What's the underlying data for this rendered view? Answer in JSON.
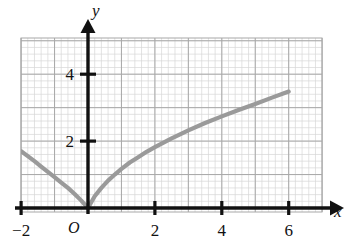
{
  "figure": {
    "background_color": "#ffffff",
    "axis_color": "#111111",
    "grid_minor_color": "#d7d7d7",
    "grid_major_color": "#a8a8a8",
    "curve_color": "#9a9a9a"
  },
  "axes": {
    "x_axis_label": "x",
    "y_axis_label": "y",
    "origin_label": "O",
    "x_ticks": [
      {
        "value": -2,
        "label": "−2"
      },
      {
        "value": 2,
        "label": "2"
      },
      {
        "value": 4,
        "label": "4"
      },
      {
        "value": 6,
        "label": "6"
      }
    ],
    "y_ticks": [
      {
        "value": 2,
        "label": "2"
      },
      {
        "value": 4,
        "label": "4"
      }
    ]
  },
  "chart_data": {
    "type": "line",
    "title": "",
    "xlabel": "x",
    "ylabel": "y",
    "xlim": [
      -2.55,
      7.05
    ],
    "ylim": [
      -0.6,
      5.1
    ],
    "grid": true,
    "minor_grid": true,
    "legend": "none",
    "series": [
      {
        "name": "curve",
        "color": "#9a9a9a",
        "x": [
          -2.0,
          -1.8,
          -1.6,
          -1.4,
          -1.2,
          -1.0,
          -0.8,
          -0.6,
          -0.4,
          -0.2,
          0.0,
          0.2,
          0.4,
          0.6,
          0.8,
          1.0,
          1.25,
          1.5,
          1.75,
          2.0,
          2.5,
          3.0,
          3.5,
          4.0,
          4.5,
          5.0,
          5.5,
          6.0
        ],
        "y": [
          1.7,
          1.55,
          1.4,
          1.24,
          1.08,
          0.92,
          0.76,
          0.6,
          0.42,
          0.22,
          0.0,
          0.35,
          0.6,
          0.82,
          1.0,
          1.17,
          1.36,
          1.52,
          1.68,
          1.82,
          2.08,
          2.32,
          2.54,
          2.74,
          2.93,
          3.11,
          3.3,
          3.48
        ]
      }
    ],
    "annotations": [
      {
        "text": "O",
        "x": -0.25,
        "y": -0.45,
        "role": "origin-label"
      }
    ]
  }
}
